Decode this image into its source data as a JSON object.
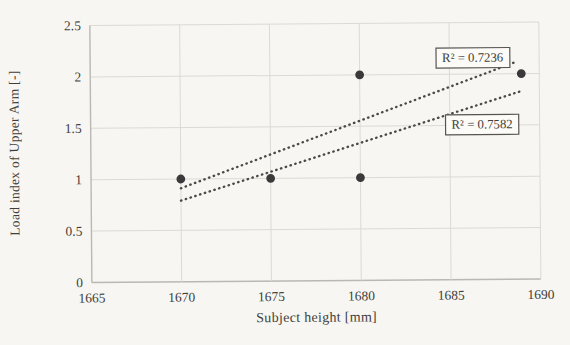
{
  "chart_data": {
    "type": "scatter",
    "title": "",
    "xlabel": "Subject height [mm]",
    "ylabel": "Load index of Upper Arm [-]",
    "xlim": [
      1665,
      1690
    ],
    "ylim": [
      0,
      2.5
    ],
    "x_ticks": [
      1665,
      1670,
      1675,
      1680,
      1685,
      1690
    ],
    "y_ticks": [
      0,
      0.5,
      1,
      1.5,
      2,
      2.5
    ],
    "grid": true,
    "legend_position": "none",
    "points": [
      {
        "x": 1670,
        "y": 1
      },
      {
        "x": 1675,
        "y": 1
      },
      {
        "x": 1680,
        "y": 1
      },
      {
        "x": 1680,
        "y": 2
      },
      {
        "x": 1689,
        "y": 2
      }
    ],
    "trendlines": [
      {
        "name": "trendline-upper",
        "style": "dotted",
        "x1": 1670,
        "y1": 0.91,
        "x2": 1688.8,
        "y2": 2.12
      },
      {
        "name": "trendline-lower",
        "style": "dotted",
        "x1": 1670,
        "y1": 0.79,
        "x2": 1689.0,
        "y2": 1.83
      }
    ],
    "annotations": [
      {
        "text": "R² = 0.7236",
        "x": 1686.3,
        "y": 2.16
      },
      {
        "text": "R² = 0.7582",
        "x": 1686.8,
        "y": 1.51
      }
    ]
  },
  "colors": {
    "background": "#f7f6f2",
    "grid": "#dbdad5",
    "axis": "#b9b8b3",
    "marker": "#3a3a3a",
    "trendline": "#4a4a4a",
    "text": "#3f3e3b",
    "annotation_border": "#565552",
    "annotation_fill": "#fcfbf8"
  }
}
